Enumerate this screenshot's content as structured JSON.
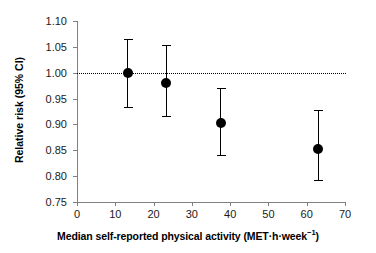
{
  "chart_data": {
    "type": "scatter",
    "title": "",
    "subtitle": "",
    "xlabel": "Median self-reported physical activity (MET·h·week⁻¹)",
    "ylabel": "Relative risk (95% CI)",
    "xlim": [
      0,
      70
    ],
    "ylim": [
      0.75,
      1.1
    ],
    "xticks": [
      0,
      10,
      20,
      30,
      40,
      50,
      60,
      70
    ],
    "xtick_labels": [
      "0",
      "10",
      "20",
      "30",
      "40",
      "50",
      "60",
      "70"
    ],
    "yticks": [
      0.75,
      0.8,
      0.85,
      0.9,
      0.95,
      1.0,
      1.05,
      1.1
    ],
    "ytick_labels": [
      "0.75",
      "0.80",
      "0.85",
      "0.90",
      "0.95",
      "1.00",
      "1.05",
      "1.10"
    ],
    "grid": false,
    "legend": "none",
    "reference_line": {
      "axis": "y",
      "value": 1.0,
      "style": "dotted",
      "color": "#000000"
    },
    "x": [
      13.2,
      23.3,
      37.6,
      63.0
    ],
    "values": [
      1.0,
      0.98,
      0.903,
      0.853
    ],
    "ci_low": [
      0.933,
      0.916,
      0.841,
      0.792
    ],
    "ci_high": [
      1.066,
      1.053,
      0.97,
      0.927
    ],
    "marker": "filled-circle",
    "marker_color": "#000000",
    "error_bar_color": "#000000",
    "points": [
      {
        "x": 13.2,
        "rr": 1.0,
        "low": 0.933,
        "high": 1.066
      },
      {
        "x": 23.3,
        "rr": 0.98,
        "low": 0.916,
        "high": 1.053
      },
      {
        "x": 37.6,
        "rr": 0.903,
        "low": 0.841,
        "high": 0.97
      },
      {
        "x": 63.0,
        "rr": 0.853,
        "low": 0.792,
        "high": 0.927
      }
    ]
  }
}
